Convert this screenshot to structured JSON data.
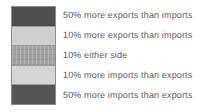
{
  "legend": {
    "title": "Trade balance legend",
    "entries": [
      {
        "label": "50% more exports than imports",
        "swatch_name": "swatch-50-more-exports",
        "color": "#4e4e4e",
        "pattern": "solid"
      },
      {
        "label": "10% more exports than imports",
        "swatch_name": "swatch-10-more-exports",
        "color": "#cfcfcf",
        "pattern": "solid"
      },
      {
        "label": "10% either side",
        "swatch_name": "swatch-10-either-side",
        "color": "#a2a2a2",
        "pattern": "hatched"
      },
      {
        "label": "10% more imports than exports",
        "swatch_name": "swatch-10-more-imports",
        "color": "#d5d5d5",
        "pattern": "solid"
      },
      {
        "label": "50% more imports than exports",
        "swatch_name": "swatch-50-more-imports",
        "color": "#555555",
        "pattern": "solid"
      }
    ]
  },
  "chart_data": {
    "type": "table",
    "title": "",
    "xlabel": "",
    "ylabel": "",
    "legend_position": "standalone",
    "grid": false,
    "categories": [
      "50% more exports than imports",
      "10% more exports than imports",
      "10% either side",
      "10% more imports than exports",
      "50% more imports than exports"
    ],
    "series": [
      {
        "name": "swatch shade",
        "values": [
          "#4e4e4e",
          "#cfcfcf",
          "#a2a2a2",
          "#d5d5d5",
          "#555555"
        ]
      }
    ]
  },
  "colors": {
    "background": "#ffffff",
    "text": "#5e5e5e",
    "swatch_border": "#8d8d8d"
  }
}
